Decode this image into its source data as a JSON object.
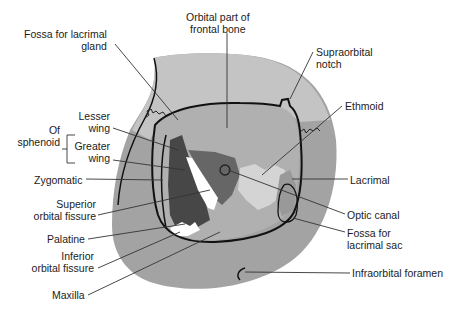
{
  "figure": {
    "colors": {
      "outer_bone": "#9c9c9c",
      "frontal_bone": "#c6c6c6",
      "orbit_roof": "#a8a8a8",
      "greater_wing": "#4a4a4a",
      "lesser_wing": "#6a6a6a",
      "ethmoid": "#d2d2d2",
      "maxilla": "#8f8f8f",
      "fissure": "#ffffff",
      "outline": "#111111",
      "leader": "#333333"
    }
  },
  "labels": {
    "orbital_part_frontal": [
      "Orbital part of",
      "frontal bone"
    ],
    "fossa_lacrimal_gland": [
      "Fossa for lacrimal",
      "gland"
    ],
    "supraorbital_notch": [
      "Supraorbital",
      "notch"
    ],
    "of_sphenoid": [
      "Of",
      "sphenoid"
    ],
    "lesser_wing": [
      "Lesser",
      "wing"
    ],
    "greater_wing": [
      "Greater",
      "wing"
    ],
    "ethmoid": "Ethmoid",
    "zygomatic": "Zygomatic",
    "lacrimal": "Lacrimal",
    "superior_orbital_fissure": [
      "Superior",
      "orbital fissure"
    ],
    "optic_canal": "Optic canal",
    "fossa_lacrimal_sac": [
      "Fossa for",
      "lacrimal sac"
    ],
    "palatine": "Palatine",
    "inferior_orbital_fissure": [
      "Inferior",
      "orbital fissure"
    ],
    "infraorbital_foramen": "Infraorbital foramen",
    "maxilla": "Maxilla"
  }
}
